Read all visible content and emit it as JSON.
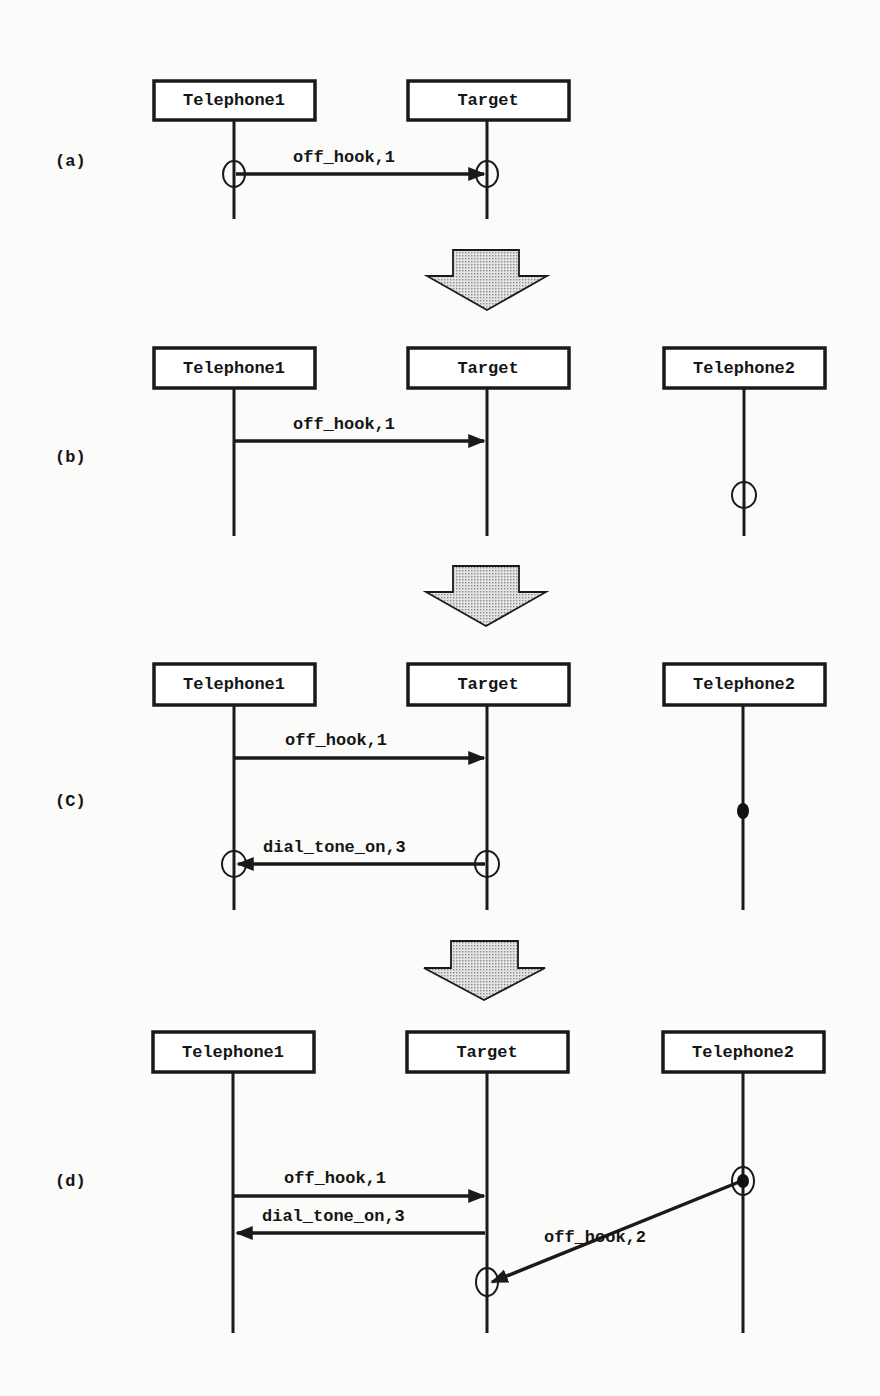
{
  "figure": {
    "panels": [
      {
        "id": "a",
        "label": "(a)",
        "objects": [
          "Telephone1",
          "Target"
        ],
        "messages": [
          {
            "label": "off_hook,1",
            "from": "Telephone1",
            "to": "Target"
          }
        ],
        "markers": [
          {
            "type": "open-circle",
            "on": "Telephone1",
            "at": "off_hook,1 send"
          },
          {
            "type": "open-circle",
            "on": "Target",
            "at": "off_hook,1 receive"
          }
        ]
      },
      {
        "id": "b",
        "label": "(b)",
        "objects": [
          "Telephone1",
          "Target",
          "Telephone2"
        ],
        "messages": [
          {
            "label": "off_hook,1",
            "from": "Telephone1",
            "to": "Target"
          }
        ],
        "markers": [
          {
            "type": "open-circle",
            "on": "Telephone2"
          }
        ]
      },
      {
        "id": "c",
        "label": "(C)",
        "objects": [
          "Telephone1",
          "Target",
          "Telephone2"
        ],
        "messages": [
          {
            "label": "off_hook,1",
            "from": "Telephone1",
            "to": "Target"
          },
          {
            "label": "dial_tone_on,3",
            "from": "Target",
            "to": "Telephone1"
          }
        ],
        "markers": [
          {
            "type": "filled-dot",
            "on": "Telephone2"
          },
          {
            "type": "open-circle",
            "on": "Target",
            "at": "dial_tone_on,3 send"
          },
          {
            "type": "open-circle",
            "on": "Telephone1",
            "at": "dial_tone_on,3 receive"
          }
        ]
      },
      {
        "id": "d",
        "label": "(d)",
        "objects": [
          "Telephone1",
          "Target",
          "Telephone2"
        ],
        "messages": [
          {
            "label": "off_hook,1",
            "from": "Telephone1",
            "to": "Target"
          },
          {
            "label": "dial_tone_on,3",
            "from": "Target",
            "to": "Telephone1"
          },
          {
            "label": "off_hook,2",
            "from": "Telephone2",
            "to": "Target"
          }
        ],
        "markers": [
          {
            "type": "circled-dot",
            "on": "Telephone2",
            "at": "off_hook,2 send"
          },
          {
            "type": "open-circle",
            "on": "Target",
            "at": "off_hook,2 receive"
          }
        ]
      }
    ],
    "transitions": [
      "a->b",
      "b->c",
      "c->d"
    ]
  },
  "labels": {
    "telephone1": "Telephone1",
    "target": "Target",
    "telephone2": "Telephone2",
    "off_hook_1": "off_hook,1",
    "off_hook_2": "off_hook,2",
    "dial_tone_on_3": "dial_tone_on,3",
    "panel_a": "(a)",
    "panel_b": "(b)",
    "panel_c": "(C)",
    "panel_d": "(d)"
  },
  "colors": {
    "ink": "#1a1a1a",
    "paper": "#fbfbfa",
    "arrow_fill": "#d9d9d9"
  }
}
